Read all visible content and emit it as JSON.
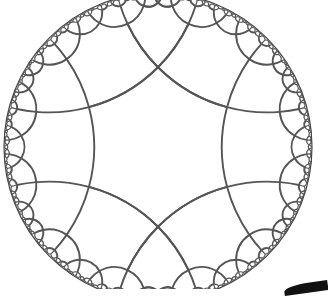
{
  "diagram": {
    "tiling": {
      "p": 6,
      "q": 4,
      "max_depth": 5
    },
    "colors": {
      "edge": "#555555",
      "boundary": "#444444",
      "background": "#ffffff"
    }
  }
}
